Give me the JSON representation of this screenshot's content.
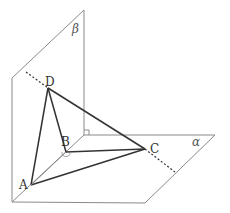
{
  "diagram": {
    "type": "solid-geometry",
    "planes": [
      {
        "name": "beta",
        "label": "β"
      },
      {
        "name": "alpha",
        "label": "α"
      }
    ],
    "points": [
      {
        "name": "A",
        "label": "A"
      },
      {
        "name": "B",
        "label": "B"
      },
      {
        "name": "C",
        "label": "C"
      },
      {
        "name": "D",
        "label": "D"
      }
    ],
    "edges": [
      "DA",
      "DB",
      "DC",
      "AB",
      "BC",
      "AC"
    ],
    "colors": {
      "plane_stroke": "#888888",
      "edge_stroke": "#333333",
      "label": "#333333"
    }
  }
}
